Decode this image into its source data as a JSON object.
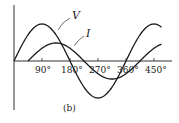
{
  "diagram": {
    "caption": "(b)",
    "axis_ticks": [
      "90°",
      "180°",
      "270°",
      "360°",
      "450°"
    ],
    "curves": [
      {
        "name": "voltage",
        "label": "V",
        "amplitude": 37,
        "phase_deg": 0
      },
      {
        "name": "current",
        "label": "I",
        "amplitude": 18,
        "phase_deg": -45
      }
    ],
    "colors": {
      "line": "#1a1a1a",
      "background": "#ffffff"
    }
  }
}
